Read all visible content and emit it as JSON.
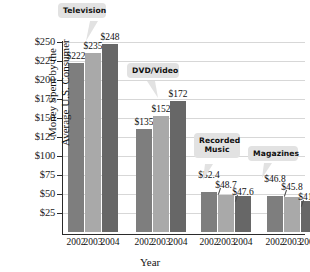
{
  "chart_data": {
    "type": "bar",
    "title": "",
    "xlabel": "Year",
    "ylabel": "Money Spent by the\nAverage U.S. Consumer",
    "ylabel_line1": "Money Spent by the",
    "ylabel_line2": "Average U.S. Consumer",
    "ylim": [
      0,
      250
    ],
    "ytick_labels": [
      "$250",
      "$225",
      "$200",
      "$175",
      "$150",
      "$125",
      "$100",
      "$75",
      "$50",
      "$25"
    ],
    "ytick_values": [
      250,
      225,
      200,
      175,
      150,
      125,
      100,
      75,
      50,
      25
    ],
    "grid": true,
    "legend_position": "none",
    "categories": [
      "2002",
      "2003",
      "2004"
    ],
    "series": [
      {
        "name": "Television",
        "values": [
          222,
          235,
          248
        ],
        "labels": [
          "$222",
          "$235",
          "$248"
        ]
      },
      {
        "name": "DVD/Video",
        "values": [
          135,
          152,
          172
        ],
        "labels": [
          "$135",
          "$152",
          "$172"
        ]
      },
      {
        "name": "Recorded Music",
        "values": [
          52.4,
          48.7,
          47.6
        ],
        "labels": [
          "$52.4",
          "$48.7",
          "$47.6"
        ]
      },
      {
        "name": "Magazines",
        "values": [
          46.8,
          45.8,
          41.2
        ],
        "labels": [
          "$46.8",
          "$45.8",
          "$41.2"
        ]
      }
    ],
    "bar_colors": [
      "#7e7e7e",
      "#a9a9a9",
      "#676767"
    ],
    "annotations": [
      {
        "text": "Television",
        "target": "Television group"
      },
      {
        "text": "DVD/Video",
        "target": "DVD/Video group"
      },
      {
        "text": "Recorded\nMusic",
        "target": "Recorded Music group"
      },
      {
        "text": "Magazines",
        "target": "Magazines group"
      }
    ]
  },
  "callouts": {
    "television": "Television",
    "dvd_video": "DVD/Video",
    "recorded_music": "Recorded\nMusic",
    "magazines": "Magazines"
  },
  "xtick_labels": [
    "2002",
    "2003",
    "2004",
    "2002",
    "2003",
    "2004",
    "2002",
    "2003",
    "2004",
    "2002",
    "2003",
    "2004"
  ],
  "bar_value_labels": [
    "$222",
    "$235",
    "$248",
    "$135",
    "$152",
    "$172",
    "$52.4",
    "$48.7",
    "$47.6",
    "$46.8",
    "$45.8",
    "$41.2"
  ]
}
